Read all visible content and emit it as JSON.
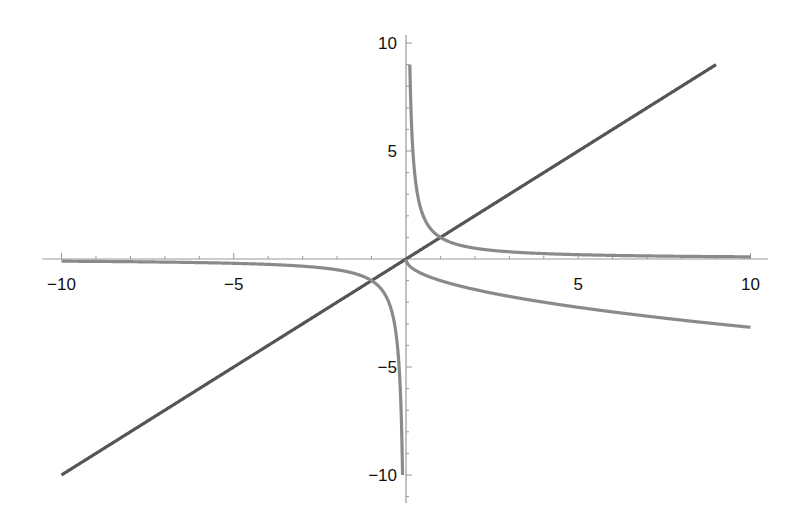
{
  "chart_data": {
    "type": "line",
    "title": "",
    "xlabel": "",
    "ylabel": "",
    "xlim": [
      -10,
      10
    ],
    "ylim": [
      -10,
      10
    ],
    "grid": false,
    "legend": null,
    "x_ticks": [
      -10,
      -5,
      5,
      10
    ],
    "y_ticks": [
      10,
      5,
      -5,
      -10
    ],
    "x_tick_labels": [
      "−10",
      "−5",
      "5",
      "10"
    ],
    "y_tick_labels": [
      "10",
      "5",
      "−5",
      "−10"
    ],
    "series": [
      {
        "name": "y = x",
        "color": "#555555",
        "x": [
          -10,
          -5,
          0,
          5,
          9
        ],
        "values": [
          -10,
          -5,
          0,
          5,
          9
        ]
      },
      {
        "name": "y = 1/x (x > 0)",
        "color": "#8a8a8a",
        "x": [
          0.11,
          0.2,
          0.5,
          1,
          2,
          5,
          10
        ],
        "values": [
          9.0,
          5.0,
          2.0,
          1.0,
          0.5,
          0.2,
          0.1
        ]
      },
      {
        "name": "y = 1/x (x < 0)",
        "color": "#8a8a8a",
        "x": [
          -10,
          -5,
          -2,
          -1,
          -0.5,
          -0.2,
          -0.1
        ],
        "values": [
          -0.1,
          -0.2,
          -0.5,
          -1.0,
          -2.0,
          -5.0,
          -10.0
        ]
      },
      {
        "name": "y = -sqrt(x)",
        "color": "#8a8a8a",
        "x": [
          0,
          1,
          2,
          4,
          6,
          8,
          10
        ],
        "values": [
          0,
          -1.0,
          -1.41,
          -2.0,
          -2.45,
          -2.83,
          -3.16
        ]
      }
    ]
  }
}
